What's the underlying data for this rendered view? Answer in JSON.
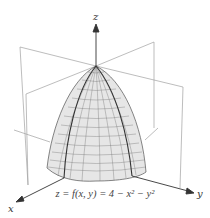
{
  "figure": {
    "caption": "z = f(x, y) = 4 − x² − y²",
    "axes": {
      "x_label": "x",
      "y_label": "y",
      "z_label": "z"
    },
    "surface": "paraboloid",
    "colors": {
      "surface_fill": "#e4e4e4",
      "mesh": "#555555",
      "plane": "#9a9a9a",
      "axis": "#333333"
    }
  }
}
